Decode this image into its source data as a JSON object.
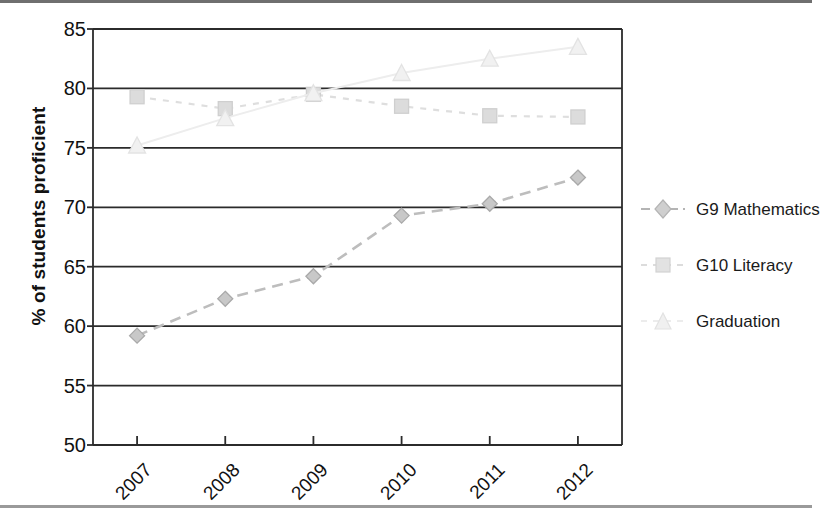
{
  "chart_data": {
    "type": "line",
    "title": "",
    "xlabel": "",
    "ylabel": "% of students proficient",
    "categories": [
      "2007",
      "2008",
      "2009",
      "2010",
      "2011",
      "2012"
    ],
    "ylim": [
      50,
      85
    ],
    "yticks": [
      50,
      55,
      60,
      65,
      70,
      75,
      80,
      85
    ],
    "grid": "horizontal",
    "legend_position": "right",
    "series": [
      {
        "name": "G9 Mathematics",
        "marker": "diamond",
        "line_style": "dashed",
        "color": "#b0b0b0",
        "values": [
          59.2,
          62.3,
          64.2,
          69.3,
          70.3,
          72.5
        ]
      },
      {
        "name": "G10 Literacy",
        "marker": "square",
        "line_style": "dashed",
        "color": "#d3d3d3",
        "values": [
          79.3,
          78.3,
          79.5,
          78.5,
          77.7,
          77.6
        ]
      },
      {
        "name": "Graduation",
        "marker": "triangle",
        "line_style": "dashed",
        "color": "#e6e6e6",
        "values": [
          75.2,
          77.5,
          79.6,
          81.3,
          82.5,
          83.5
        ]
      }
    ]
  },
  "axis": {
    "y_tick_labels": [
      "85",
      "80",
      "75",
      "70",
      "65",
      "60",
      "55",
      "50"
    ],
    "x_tick_labels": [
      "2007",
      "2008",
      "2009",
      "2010",
      "2011",
      "2012"
    ],
    "y_title": "% of students proficient"
  },
  "legend": {
    "items": [
      {
        "label": "G9 Mathematics",
        "marker": "diamond-marker",
        "color": "#b4b4b4"
      },
      {
        "label": "G10 Literacy",
        "marker": "square-marker",
        "color": "#d6d6d6"
      },
      {
        "label": "Graduation",
        "marker": "triangle-marker",
        "color": "#e8e8e8"
      }
    ]
  },
  "colors": {
    "axis": "#2b2b2b",
    "gridline": "#2b2b2b",
    "background": "#ffffff",
    "text": "#111111"
  }
}
